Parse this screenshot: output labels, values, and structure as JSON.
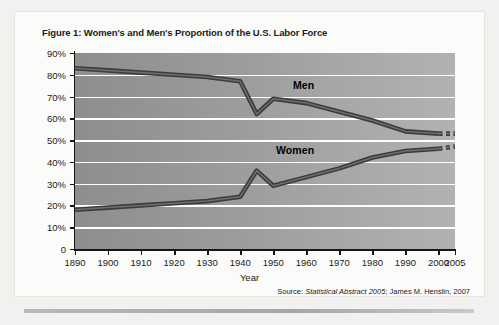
{
  "figure": {
    "title": "Figure 1: Women's and Men's Proportion of the U.S. Labor Force",
    "axis_title_x": "Year",
    "axis_title_y": "Percentage",
    "source_prefix": "Source:",
    "source_italic": "Statistical Abstract 2005",
    "source_rest": ";  James M. Henslin, 2007"
  },
  "chart_data": {
    "type": "line",
    "title": "Figure 1: Women's and Men's Proportion of the U.S. Labor Force",
    "xlabel": "Year",
    "ylabel": "Percentage",
    "xlim": [
      1890,
      2005
    ],
    "ylim": [
      0,
      90
    ],
    "grid": true,
    "legend": "inline-labels",
    "x_ticks": [
      1890,
      1900,
      1910,
      1920,
      1930,
      1940,
      1950,
      1960,
      1970,
      1980,
      1990,
      2000,
      2005
    ],
    "x_tick_labels": [
      "1890",
      "1900",
      "1910",
      "1920",
      "1930",
      "1940",
      "1950",
      "1960",
      "1970",
      "1980",
      "1990",
      "2000",
      "2005"
    ],
    "y_ticks": [
      0,
      10,
      20,
      30,
      40,
      50,
      60,
      70,
      80,
      90
    ],
    "y_tick_labels": [
      "0",
      "10%",
      "20%",
      "30%",
      "40%",
      "50%",
      "60%",
      "70%",
      "80%",
      "90%"
    ],
    "series": [
      {
        "name": "Men",
        "color": "#3c3c3c",
        "x": [
          1890,
          1900,
          1910,
          1920,
          1930,
          1940,
          1945,
          1950,
          1960,
          1970,
          1980,
          1990,
          2000,
          2005
        ],
        "values": [
          83,
          82,
          81,
          80,
          79,
          77,
          62,
          69,
          67,
          63,
          59,
          54,
          53,
          53
        ]
      },
      {
        "name": "Women",
        "color": "#3c3c3c",
        "x": [
          1890,
          1900,
          1910,
          1920,
          1930,
          1940,
          1945,
          1950,
          1960,
          1970,
          1980,
          1990,
          2000,
          2005
        ],
        "values": [
          18,
          19,
          20,
          21,
          22,
          24,
          36,
          29,
          33,
          37,
          42,
          45,
          46,
          47
        ]
      }
    ],
    "annotations": [
      {
        "text": "Men",
        "x": 1962,
        "y": 74
      },
      {
        "text": "Women",
        "x": 1955,
        "y": 50
      }
    ]
  }
}
